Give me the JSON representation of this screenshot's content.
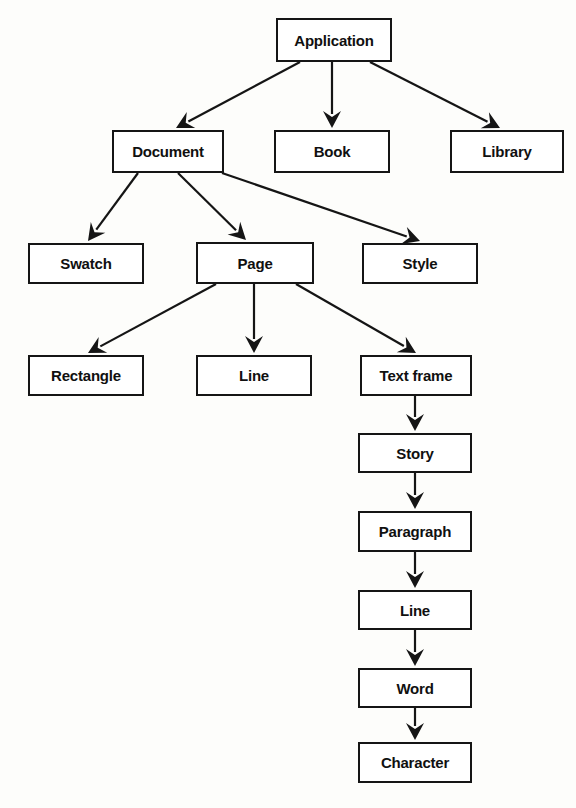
{
  "diagram": {
    "type": "tree-diagram",
    "background_color": "#fdfdfb",
    "box_fill_color": "#ffffff",
    "box_border_color": "#151515",
    "arrow_color": "#151515",
    "nodes": [
      {
        "id": "application",
        "label": "Application",
        "x": 276,
        "y": 18,
        "w": 116,
        "h": 44
      },
      {
        "id": "document",
        "label": "Document",
        "x": 112,
        "y": 130,
        "w": 112,
        "h": 43
      },
      {
        "id": "book",
        "label": "Book",
        "x": 274,
        "y": 130,
        "w": 116,
        "h": 43
      },
      {
        "id": "library",
        "label": "Library",
        "x": 450,
        "y": 130,
        "w": 114,
        "h": 43
      },
      {
        "id": "swatch",
        "label": "Swatch",
        "x": 28,
        "y": 243,
        "w": 116,
        "h": 41
      },
      {
        "id": "page",
        "label": "Page",
        "x": 196,
        "y": 242,
        "w": 118,
        "h": 42
      },
      {
        "id": "style",
        "label": "Style",
        "x": 362,
        "y": 243,
        "w": 116,
        "h": 41
      },
      {
        "id": "rectangle",
        "label": "Rectangle",
        "x": 28,
        "y": 355,
        "w": 116,
        "h": 41
      },
      {
        "id": "line-page",
        "label": "Line",
        "x": 196,
        "y": 355,
        "w": 116,
        "h": 41
      },
      {
        "id": "textframe",
        "label": "Text frame",
        "x": 360,
        "y": 355,
        "w": 112,
        "h": 41
      },
      {
        "id": "story",
        "label": "Story",
        "x": 358,
        "y": 433,
        "w": 114,
        "h": 40
      },
      {
        "id": "paragraph",
        "label": "Paragraph",
        "x": 358,
        "y": 511,
        "w": 114,
        "h": 41
      },
      {
        "id": "line-story",
        "label": "Line",
        "x": 358,
        "y": 590,
        "w": 114,
        "h": 40
      },
      {
        "id": "word",
        "label": "Word",
        "x": 358,
        "y": 668,
        "w": 114,
        "h": 40
      },
      {
        "id": "character",
        "label": "Character",
        "x": 358,
        "y": 742,
        "w": 114,
        "h": 41
      }
    ],
    "edges": [
      {
        "from": "application",
        "to": "document",
        "x1": 300,
        "y1": 62,
        "x2": 176,
        "y2": 128
      },
      {
        "from": "application",
        "to": "book",
        "x1": 332,
        "y1": 62,
        "x2": 332,
        "y2": 128
      },
      {
        "from": "application",
        "to": "library",
        "x1": 370,
        "y1": 62,
        "x2": 500,
        "y2": 128
      },
      {
        "from": "document",
        "to": "swatch",
        "x1": 138,
        "y1": 173,
        "x2": 88,
        "y2": 241
      },
      {
        "from": "document",
        "to": "page",
        "x1": 178,
        "y1": 173,
        "x2": 246,
        "y2": 240
      },
      {
        "from": "document",
        "to": "style",
        "x1": 222,
        "y1": 173,
        "x2": 420,
        "y2": 241
      },
      {
        "from": "page",
        "to": "rectangle",
        "x1": 216,
        "y1": 284,
        "x2": 88,
        "y2": 353
      },
      {
        "from": "page",
        "to": "line-page",
        "x1": 254,
        "y1": 284,
        "x2": 254,
        "y2": 353
      },
      {
        "from": "page",
        "to": "textframe",
        "x1": 296,
        "y1": 284,
        "x2": 416,
        "y2": 353
      },
      {
        "from": "textframe",
        "to": "story",
        "x1": 415,
        "y1": 396,
        "x2": 415,
        "y2": 431
      },
      {
        "from": "story",
        "to": "paragraph",
        "x1": 415,
        "y1": 473,
        "x2": 415,
        "y2": 509
      },
      {
        "from": "paragraph",
        "to": "line-story",
        "x1": 415,
        "y1": 552,
        "x2": 415,
        "y2": 588
      },
      {
        "from": "line-story",
        "to": "word",
        "x1": 415,
        "y1": 630,
        "x2": 415,
        "y2": 666
      },
      {
        "from": "word",
        "to": "character",
        "x1": 415,
        "y1": 708,
        "x2": 415,
        "y2": 740
      }
    ]
  }
}
